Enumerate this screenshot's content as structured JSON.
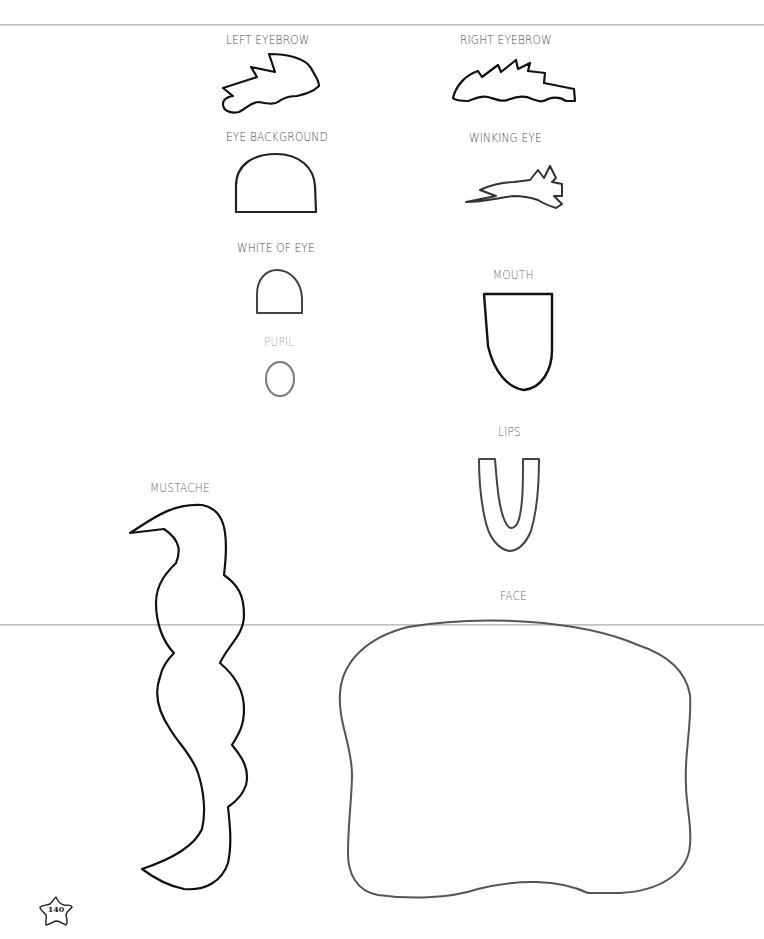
{
  "page": {
    "number": "140",
    "ink_color": "#111111",
    "label_color": "#4a4a4a",
    "fold_line_color": "#bdbdbd"
  },
  "templates": {
    "left_eyebrow": {
      "label": "LEFT EYEBROW"
    },
    "right_eyebrow": {
      "label": "RIGHT EYEBROW"
    },
    "eye_background": {
      "label": "EYE BACKGROUND"
    },
    "winking_eye": {
      "label": "WINKING EYE"
    },
    "white_of_eye": {
      "label": "WHITE OF EYE"
    },
    "pupil": {
      "label": "PUPIL"
    },
    "mouth": {
      "label": "MOUTH"
    },
    "lips": {
      "label": "LIPS"
    },
    "mustache": {
      "label": "MUSTACHE"
    },
    "face": {
      "label": "FACE"
    }
  }
}
